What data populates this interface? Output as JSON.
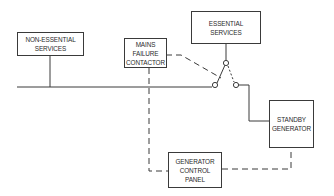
{
  "diagram": {
    "type": "standby-generator-wiring-schematic",
    "line_color": "#3a3a3a",
    "background": "#ffffff",
    "nodes": {
      "non_essential": {
        "line1": "NON-ESSENTIAL",
        "line2": "SERVICES"
      },
      "mains_failure": {
        "line1": "MAINS",
        "line2": "FAILURE",
        "line3": "CONTACTOR"
      },
      "essential": {
        "line1": "ESSENTIAL",
        "line2": "SERVICES"
      },
      "standby": {
        "line1": "STANDBY",
        "line2": "GENERATOR"
      },
      "control_panel": {
        "line1": "GENERATOR",
        "line2": "CONTROL",
        "line3": "PANEL"
      }
    },
    "edges": [
      {
        "from": "non_essential",
        "to": "mains_bus",
        "style": "solid"
      },
      {
        "from": "mains_bus",
        "to": "changeover_switch",
        "style": "solid"
      },
      {
        "from": "changeover_switch",
        "to": "essential",
        "style": "solid"
      },
      {
        "from": "changeover_switch",
        "to": "standby",
        "style": "solid"
      },
      {
        "from": "mains_failure",
        "to": "changeover_switch",
        "style": "dashed"
      },
      {
        "from": "mains_failure",
        "to": "control_panel",
        "style": "dashed"
      },
      {
        "from": "standby",
        "to": "control_panel",
        "style": "dashed"
      }
    ]
  }
}
